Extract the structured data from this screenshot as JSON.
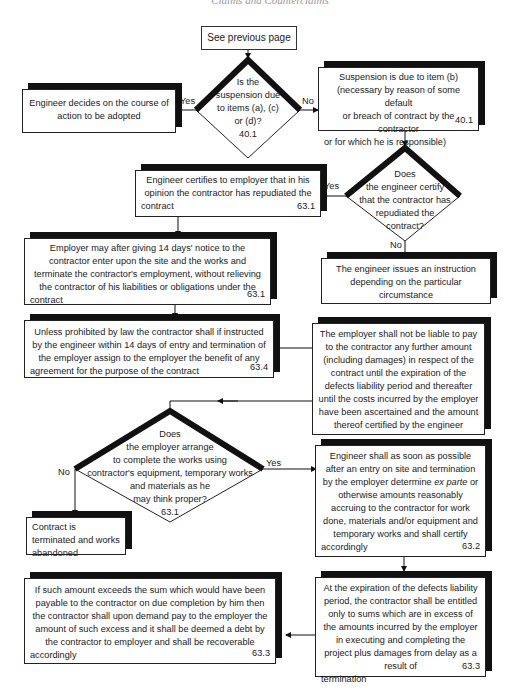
{
  "page": {
    "header": "Claims and Counterclaims",
    "page_number": "103"
  },
  "start": {
    "label": "See previous page"
  },
  "decision1": {
    "text": [
      "Is the",
      "suspension due",
      "to items (a), (c)",
      "or (d)?",
      "40.1"
    ],
    "yes": "Yes",
    "no": "No"
  },
  "engineer_decides": {
    "text": "Engineer decides on the course of action to be adopted"
  },
  "suspension_b": {
    "lines": [
      "Suspension is due to item (b)",
      "(necessary by reason of some default",
      "or breach of contract by the contractor"
    ],
    "last": "or for which he is responsible)",
    "ref": "40.1"
  },
  "decision2": {
    "text": [
      "Does",
      "the engineer certify",
      "that the contractor has",
      "repudiated the",
      "contract?"
    ],
    "yes": "Yes",
    "no": "No"
  },
  "engineer_certifies": {
    "lines": [
      "Engineer certifies to employer that in his",
      "opinion the contractor has repudiated the"
    ],
    "last": "contract",
    "ref": "63.1"
  },
  "engineer_instruction": {
    "text": "The engineer issues an instruction depending on the particular circumstance"
  },
  "employer_notice": {
    "lines": [
      "Employer may after giving 14 days' notice to the",
      "contractor enter upon the site and the works and",
      "terminate the contractor's employment, without relieving",
      "the contractor of his liabilities or obligations under the"
    ],
    "last": "contract",
    "ref": "63.1"
  },
  "unless_prohibited": {
    "lines": [
      "Unless prohibited by law the contractor shall if instructed",
      "by the engineer within 14 days of entry and termination of",
      "the employer assign to the employer the benefit of any"
    ],
    "last": "agreement for the purpose of the contract",
    "ref": "63.4"
  },
  "employer_not_liable": {
    "text": "The employer shall not be liable to pay to the contractor any further amount (including damages) in respect of the contract until the expiration of the defects liability period and thereafter until the costs incurred by the employer have been ascertained and the amount thereof certified by the engineer"
  },
  "decision3": {
    "text": [
      "Does",
      "the employer arrange",
      "to complete the works using",
      "contractor's equipment, temporary works",
      "and materials as he",
      "may think proper?",
      "63.1"
    ],
    "yes": "Yes",
    "no": "No"
  },
  "contract_terminated": {
    "text": "Contract is terminated and works abandoned"
  },
  "engineer_determine": {
    "lines_before": "Engineer shall as soon as possible after an entry on site and termination by the employer determine ",
    "italic": "ex parte",
    "lines_after": " or otherwise amounts reasonably accruing to the contractor for work done, materials and/or equipment and temporary works and shall certify",
    "last": "accordingly",
    "ref": "63.2"
  },
  "expiration": {
    "text": "At the expiration of the defects liability period, the contractor shall be entitled only to sums which are in excess of the amounts incurred by the employer in executing and completing the project plus damages from delay as a result of",
    "last": "termination",
    "ref": "63.3"
  },
  "excess": {
    "text": "If such amount exceeds the sum which would have been payable to the contractor on due completion by him then the contractor shall upon demand pay to the employer the amount of such excess and it shall be deemed a debt by the contractor to employer and shall be recoverable",
    "last": "accordingly",
    "ref": "63.3"
  }
}
